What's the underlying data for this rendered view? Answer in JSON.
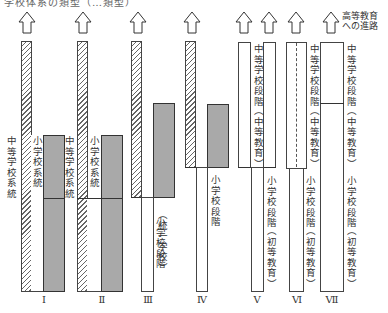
{
  "header_cut_text": "学校体系の類型（…類型）",
  "arrow_note": {
    "line1": "高等教育",
    "line2": "への進路"
  },
  "arrows_x": [
    27,
    83,
    138,
    192,
    244,
    269,
    296,
    331
  ],
  "labels": {
    "secondary_system": "中等学校系統",
    "primary_system": "小学校系統",
    "primary_stage": "小学校段階",
    "unified_primary_stage": "小学校段階",
    "unified_paren": "（統一学校）",
    "secondary_stage": "中等学校段階",
    "secondary_edu": "（中等教育）",
    "primary_edu": "（初等教育）"
  },
  "types": [
    {
      "numeral": "Ⅰ"
    },
    {
      "numeral": "Ⅱ"
    },
    {
      "numeral": "Ⅲ"
    },
    {
      "numeral": "Ⅳ"
    },
    {
      "numeral": "Ⅴ"
    },
    {
      "numeral": "Ⅵ"
    },
    {
      "numeral": "Ⅶ"
    }
  ]
}
